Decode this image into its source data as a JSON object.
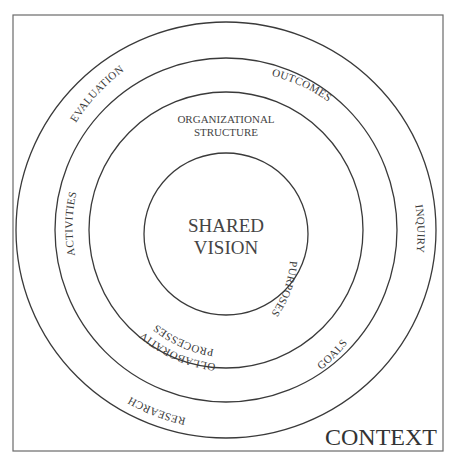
{
  "diagram": {
    "center": [
      "SHARED",
      "VISION"
    ],
    "frame_label": "CONTEXT",
    "inner_ring_labels": {
      "top": [
        "ORGANIZATIONAL",
        "STRUCTURE"
      ],
      "left_bottom": [
        "COLLABORATIVE",
        "PROCESSES"
      ],
      "right": "PURPOSES"
    },
    "middle_ring_labels": {
      "top_right": "OUTCOMES",
      "left": "ACTIVITIES",
      "bottom_right": "GOALS"
    },
    "outer_ring_labels": {
      "top_left": "EVALUATION",
      "right": "INQUIRY",
      "bottom_left": "RESEARCH"
    }
  }
}
